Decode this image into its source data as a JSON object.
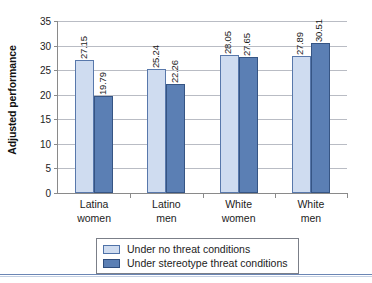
{
  "chart_data": {
    "type": "bar",
    "title": "",
    "xlabel": "",
    "ylabel": "Adjusted performance",
    "ylim": [
      0,
      35
    ],
    "yticks": [
      0,
      5,
      10,
      15,
      20,
      25,
      30,
      35
    ],
    "ytick_labels": [
      "0",
      "5",
      "10",
      "15",
      "20",
      "25",
      "30",
      "35"
    ],
    "grid": true,
    "legend_position": "bottom",
    "categories": [
      "Latina women",
      "Latino men",
      "White women",
      "White men"
    ],
    "category_lines": [
      [
        "Latina",
        "women"
      ],
      [
        "Latino",
        "men"
      ],
      [
        "White",
        "women"
      ],
      [
        "White",
        "men"
      ]
    ],
    "series": [
      {
        "name": "Under no threat conditions",
        "color": "#cfdcf0",
        "border_color": "#5878ab",
        "values": [
          27.15,
          25.24,
          28.05,
          27.89
        ],
        "labels": [
          "27.15",
          "25.24",
          "28.05",
          "27.89"
        ]
      },
      {
        "name": "Under stereotype threat conditions",
        "color": "#5b7fb4",
        "border_color": "#365584",
        "values": [
          19.79,
          22.26,
          27.65,
          30.51
        ],
        "labels": [
          "19.79",
          "22.26",
          "27.65",
          "30.51"
        ]
      }
    ]
  }
}
